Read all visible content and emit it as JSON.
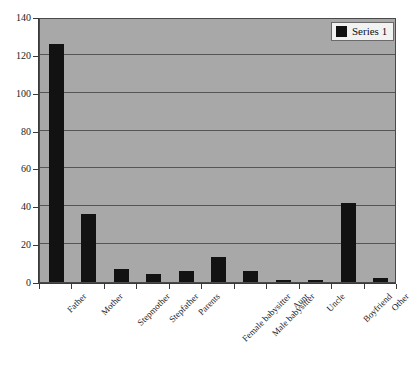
{
  "chart_data": {
    "type": "bar",
    "title": "",
    "subtitle": "",
    "xlabel": "",
    "ylabel": "",
    "ylim": [
      0,
      140
    ],
    "ytick_labels": [
      "0",
      "20",
      "40",
      "60",
      "80",
      "100",
      "120",
      "140"
    ],
    "ytick_values": [
      0,
      20,
      40,
      60,
      80,
      100,
      120,
      140
    ],
    "grid": true,
    "legend_position": "top-right",
    "categories": [
      "Father",
      "Mother",
      "Stepmother",
      "Stepfather",
      "Parents",
      "Female babysitter",
      "Male babysitter",
      "Aunt",
      "Uncle",
      "Boyfriend",
      "Other"
    ],
    "series": [
      {
        "name": "Series 1",
        "color": "#121212",
        "values": [
          126,
          36,
          7,
          4,
          6,
          13,
          6,
          1,
          1,
          42,
          2
        ]
      }
    ]
  },
  "legend": {
    "entries": [
      {
        "label": "Series 1",
        "swatch_name": "legend-swatch-series-1"
      }
    ]
  },
  "colors": {
    "plot_background": "#a8a8a8",
    "figure_background": "#ffffff",
    "bar": "#121212",
    "gridline": "#555555",
    "axis": "#3a3a3a",
    "legend_background": "#f2f2f2"
  }
}
